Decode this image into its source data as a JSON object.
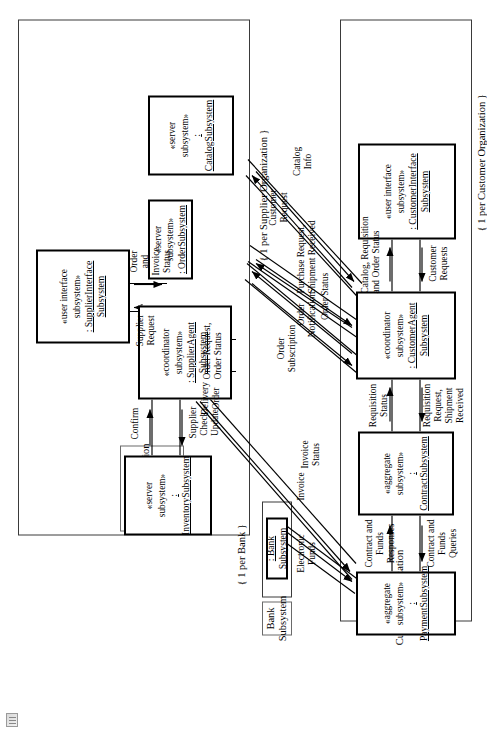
{
  "diagram": {
    "type": "uml-subsystem-communication-diagram",
    "groups": [
      {
        "id": "supplier-organization",
        "tag_label": "SupplierOrganization\nSubsystem",
        "constraint": "{ 1 per Supplier Organization }"
      },
      {
        "id": "bank",
        "tag_label": "Bank\nSubsystem",
        "constraint": "{ 1 per Bank }"
      },
      {
        "id": "customer-organization",
        "tag_label": "CustomerOrganization\nSubsystem",
        "constraint": "{ 1 per Customer Organization }"
      }
    ],
    "nodes": [
      {
        "id": "inventory",
        "stereotype": "«server subsystem»",
        "name": ": InventorySubsystem"
      },
      {
        "id": "supplier-interface",
        "stereotype": "«user interface\nsubsystem»",
        "name": ": SupplierInterface\nSubsystem"
      },
      {
        "id": "supplier-agent",
        "stereotype": "«coordinator\nsubsystem»",
        "name": ": SupplierAgent\nSubsystem"
      },
      {
        "id": "order",
        "stereotype": "«server subsystem»",
        "name": ": OrderSubsystem"
      },
      {
        "id": "catalog",
        "stereotype": "«server subsystem»",
        "name": ": CatalogSubsystem"
      },
      {
        "id": "bank-subsystem",
        "stereotype": "",
        "name": ": Bank\nSubsystem"
      },
      {
        "id": "payment",
        "stereotype": "«aggregate subsystem»",
        "name": ": PaymentSubsystem"
      },
      {
        "id": "contract",
        "stereotype": "«aggregate subsystem»",
        "name": ": ContractSubsystem"
      },
      {
        "id": "customer-agent",
        "stereotype": "«coordinator subsystem»",
        "name": ": CustomerAgent\nSubsystem"
      },
      {
        "id": "customer-interface",
        "stereotype": "«user interface\nsubsystem»",
        "name": ": CustomerInterface\nSubsystem"
      }
    ],
    "messages": [
      {
        "id": "confirm",
        "text": "Confirm"
      },
      {
        "id": "supplier-check-update",
        "text": "Supplier\nCheck,\nUpdate"
      },
      {
        "id": "supplier-request",
        "text": "Supplier\nRequest"
      },
      {
        "id": "order-and-invoice-status",
        "text": "Order\nand\nInvoice\nStatus"
      },
      {
        "id": "order-request-order-status",
        "text": "Order Request,\nOrder Status"
      },
      {
        "id": "delivery-order",
        "text": "Delivery\nOrder"
      },
      {
        "id": "electronic-funds",
        "text": "Electronic\nFunds"
      },
      {
        "id": "invoice",
        "text": "Invoice"
      },
      {
        "id": "invoice-status",
        "text": "Invoice\nStatus"
      },
      {
        "id": "order-subscription",
        "text": "Order\nSubscription"
      },
      {
        "id": "order-notification",
        "text": "Order\nNotification"
      },
      {
        "id": "order-status",
        "text": "Order Status"
      },
      {
        "id": "purchase-request-shipment-received",
        "text": "Purchase Request,\nShipment Received"
      },
      {
        "id": "customer-request",
        "text": "Customer\nRequest"
      },
      {
        "id": "catalog-info",
        "text": "Catalog\nInfo"
      },
      {
        "id": "contract-and-funds-responses",
        "text": "Contract and\nFunds\nResponses"
      },
      {
        "id": "contract-and-funds-queries",
        "text": "Contract and\nFunds\nQueries"
      },
      {
        "id": "requisition-status",
        "text": "Requisition\nStatus"
      },
      {
        "id": "requisition-request-shipment-received",
        "text": "Requisition\nRequest,\nShipment\nReceived"
      },
      {
        "id": "catalog-requisition-and-order-status",
        "text": "Catalog, Requisition\nand Order Status"
      },
      {
        "id": "customer-requests",
        "text": "Customer\nRequests"
      }
    ]
  }
}
